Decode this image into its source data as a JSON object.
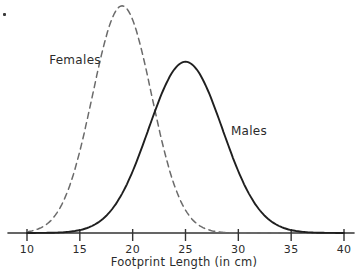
{
  "page": {
    "background": "#ffffff",
    "ink_color": "#2b2b2b"
  },
  "chart_data": {
    "type": "line",
    "subtype": "normal-distribution-curves",
    "title": "",
    "xlabel": "Footprint Length (in cm)",
    "ylabel": "",
    "xlim": [
      10,
      40
    ],
    "x_ticks": [
      10,
      15,
      20,
      25,
      30,
      35,
      40
    ],
    "grid": false,
    "legend_position": "inline-annotations",
    "series": [
      {
        "name": "Females",
        "style": "dashed",
        "color": "#6b6b6b",
        "mean": 19,
        "sd": 2.8,
        "peak_fraction": 0.975
      },
      {
        "name": "Males",
        "style": "solid",
        "color": "#1f1f1f",
        "mean": 25,
        "sd": 3.5,
        "peak_fraction": 0.735
      }
    ],
    "annotations": [
      {
        "text": "Females",
        "anchor_cm": 14.5,
        "side": "left-of-curve"
      },
      {
        "text": "Males",
        "anchor_cm": 31.0,
        "side": "right-of-curve"
      }
    ]
  }
}
